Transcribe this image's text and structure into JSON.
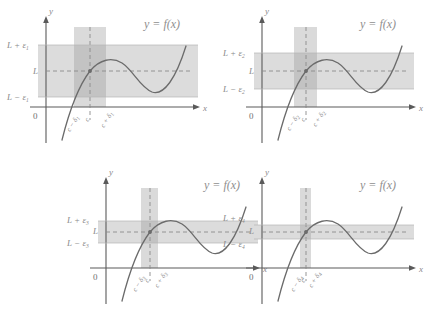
{
  "figure": {
    "caption": "Epsilon-delta definition of limit: four panels showing progressively smaller epsilon bands and corresponding delta intervals",
    "colors": {
      "band": "#d9d9d9",
      "strip": "#d0d0d0",
      "overlap": "#b9b9b9",
      "curve": "#6b6b6b",
      "axis": "#5a5a5a",
      "dashed": "#8a8a8a",
      "label": "#8a8a8a",
      "background": "#ffffff"
    },
    "common": {
      "function_label": "y = f(x)",
      "y_axis_label": "y",
      "x_axis_label": "x",
      "origin_label": "0",
      "limit_label": "L",
      "center_label": "c"
    },
    "panels": [
      {
        "id": "panel-1",
        "position": "top-left",
        "epsilon_index": "1",
        "upper_label": "L + ε",
        "lower_label": "L − ε",
        "limit_label": "L",
        "function_label": "y = f(x)",
        "origin_label": "0",
        "x_axis_label": "x",
        "y_axis_label": "y",
        "tick_left": "c − δ",
        "tick_center": "c",
        "tick_right": "c + δ",
        "delta_index": "1",
        "epsilon_value": 26,
        "delta_value": 22
      },
      {
        "id": "panel-2",
        "position": "top-right",
        "epsilon_index": "2",
        "upper_label": "L + ε",
        "lower_label": "L − ε",
        "limit_label": "L",
        "function_label": "y = f(x)",
        "origin_label": "0",
        "x_axis_label": "x",
        "y_axis_label": "y",
        "tick_left": "c − δ",
        "tick_center": "c",
        "tick_right": "c + δ",
        "delta_index": "2",
        "epsilon_value": 17,
        "delta_value": 15
      },
      {
        "id": "panel-3",
        "position": "bottom-left",
        "epsilon_index": "3",
        "upper_label": "L + ε",
        "lower_label": "L − ε",
        "limit_label": "L",
        "function_label": "y = f(x)",
        "origin_label": "0",
        "x_axis_label": "x",
        "y_axis_label": "y",
        "tick_left": "c − δ",
        "tick_center": "c",
        "tick_right": "c + δ",
        "delta_index": "3",
        "epsilon_value": 10,
        "delta_value": 10
      },
      {
        "id": "panel-4",
        "position": "bottom-right",
        "epsilon_index": "4",
        "upper_label": "L + ε",
        "lower_label": "L − ε",
        "limit_label": "L",
        "function_label": "y = f(x)",
        "origin_label": "0",
        "x_axis_label": "x",
        "y_axis_label": "y",
        "tick_left": "c − δ",
        "tick_center": "c",
        "tick_right": "c + δ",
        "delta_index": "4",
        "epsilon_value": 6,
        "delta_value": 5
      }
    ]
  }
}
